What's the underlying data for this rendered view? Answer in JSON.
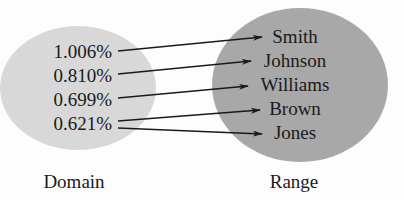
{
  "domain": {
    "label": "Domain",
    "color": "#d8d8d8",
    "values": [
      "1.006%",
      "0.810%",
      "0.699%",
      "0.621%"
    ]
  },
  "range": {
    "label": "Range",
    "color": "#a8a8a8",
    "values": [
      "Smith",
      "Johnson",
      "Williams",
      "Brown",
      "Jones"
    ]
  },
  "mapping": [
    {
      "from": "1.006%",
      "to": "Smith"
    },
    {
      "from": "0.810%",
      "to": "Johnson"
    },
    {
      "from": "0.699%",
      "to": "Williams"
    },
    {
      "from": "0.621%",
      "to": "Brown"
    },
    {
      "from": "0.621%",
      "to": "Jones"
    }
  ],
  "colors": {
    "background": "#fdfdfd",
    "text": "#1a1a1a",
    "arrow": "#1a1a1a"
  }
}
